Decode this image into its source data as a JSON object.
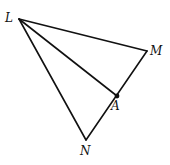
{
  "diagram": {
    "type": "geometry-triangle",
    "points": {
      "L": {
        "label": "L",
        "x": 19,
        "y": 19,
        "label_x": 5,
        "label_y": 22
      },
      "M": {
        "label": "M",
        "x": 147,
        "y": 51,
        "label_x": 150,
        "label_y": 55
      },
      "N": {
        "label": "N",
        "x": 86,
        "y": 140,
        "label_x": 80,
        "label_y": 155
      },
      "A": {
        "label": "A",
        "x": 117,
        "y": 96,
        "label_x": 111,
        "label_y": 110
      }
    },
    "segments": [
      {
        "name": "LM",
        "from": "L",
        "to": "M"
      },
      {
        "name": "MN",
        "from": "M",
        "to": "N"
      },
      {
        "name": "NL",
        "from": "N",
        "to": "L"
      },
      {
        "name": "LA",
        "from": "L",
        "to": "A"
      }
    ],
    "marked_points": [
      "A"
    ],
    "colors": {
      "stroke": "#111111",
      "background": "#ffffff"
    }
  }
}
